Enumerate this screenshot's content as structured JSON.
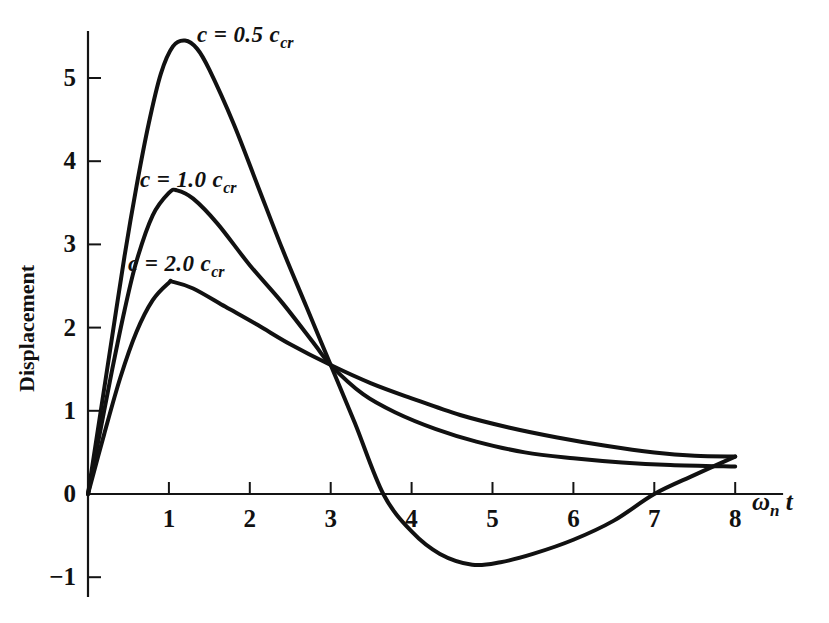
{
  "figure": {
    "background_color": "#ffffff",
    "ink_color": "#111111"
  },
  "axis": {
    "x_title_main": "ω",
    "x_title_sub": "n",
    "x_title_tail": "t",
    "y_title": "Displacement",
    "x_tick_labels": [
      "1",
      "2",
      "3",
      "4",
      "5",
      "6",
      "7",
      "8"
    ],
    "y_tick_labels": [
      "5",
      "4",
      "3",
      "2",
      "1",
      "0",
      "−1"
    ]
  },
  "curve_labels": [
    {
      "prefix": "c  =  0.5 c",
      "sub": "cr"
    },
    {
      "prefix": "c  =  1.0 c",
      "sub": "cr"
    },
    {
      "prefix": "c  =  2.0 c",
      "sub": "cr"
    }
  ],
  "chart_data": {
    "type": "line",
    "title": "",
    "xlabel": "ωₙ t",
    "ylabel": "Displacement",
    "xlim": [
      0,
      8.55
    ],
    "ylim": [
      -1.35,
      5.9
    ],
    "xticks": [
      1,
      2,
      3,
      4,
      5,
      6,
      7,
      8
    ],
    "yticks": [
      -1,
      0,
      1,
      2,
      3,
      4,
      5
    ],
    "grid": false,
    "legend": "inline-annotations",
    "series": [
      {
        "name": "c = 0.5 c_cr",
        "label_text": "c  =  0.5 c_cr",
        "peak_value": 5.45,
        "peak_x": 1.2,
        "min_value": -0.85,
        "min_x": 4.75,
        "zero_crossings": [
          3.65,
          7.0
        ],
        "end_value": 0.45,
        "x": [
          0,
          0.15,
          0.3,
          0.45,
          0.6,
          0.75,
          0.9,
          1.05,
          1.2,
          1.35,
          1.5,
          1.8,
          2.1,
          2.4,
          2.7,
          3.0,
          3.3,
          3.65,
          4.0,
          4.35,
          4.75,
          5.1,
          5.5,
          6.0,
          6.5,
          7.0,
          7.5,
          8.0
        ],
        "y": [
          0,
          0.95,
          1.9,
          2.85,
          3.7,
          4.45,
          5.05,
          5.38,
          5.45,
          5.35,
          5.1,
          4.45,
          3.7,
          2.95,
          2.25,
          1.55,
          0.85,
          0.0,
          -0.45,
          -0.72,
          -0.85,
          -0.82,
          -0.72,
          -0.55,
          -0.32,
          0.0,
          0.23,
          0.45
        ]
      },
      {
        "name": "c = 1.0 c_cr",
        "label_text": "c  =  1.0 c_cr",
        "peak_value": 3.65,
        "peak_x": 1.1,
        "min_value": null,
        "end_value": 0.33,
        "x": [
          0,
          0.15,
          0.3,
          0.45,
          0.6,
          0.8,
          1.0,
          1.1,
          1.3,
          1.6,
          2.0,
          2.4,
          2.8,
          3.0,
          3.4,
          3.8,
          4.3,
          4.8,
          5.4,
          6.0,
          6.6,
          7.2,
          8.0
        ],
        "y": [
          0,
          0.75,
          1.5,
          2.2,
          2.8,
          3.35,
          3.62,
          3.65,
          3.55,
          3.25,
          2.75,
          2.3,
          1.8,
          1.55,
          1.2,
          0.98,
          0.78,
          0.63,
          0.5,
          0.43,
          0.38,
          0.35,
          0.33
        ]
      },
      {
        "name": "c = 2.0 c_cr",
        "label_text": "c  =  2.0 c_cr",
        "peak_value": 2.55,
        "peak_x": 1.05,
        "min_value": null,
        "end_value": 0.45,
        "x": [
          0,
          0.2,
          0.4,
          0.6,
          0.8,
          1.0,
          1.05,
          1.3,
          1.7,
          2.1,
          2.5,
          3.0,
          3.5,
          4.0,
          4.6,
          5.2,
          5.8,
          6.4,
          7.0,
          7.5,
          8.0
        ],
        "y": [
          0,
          0.72,
          1.4,
          1.95,
          2.33,
          2.54,
          2.55,
          2.47,
          2.25,
          2.03,
          1.8,
          1.55,
          1.33,
          1.15,
          0.95,
          0.8,
          0.68,
          0.58,
          0.5,
          0.46,
          0.45
        ]
      }
    ]
  },
  "geometry": {
    "origin_px": {
      "x": 88,
      "y": 494
    },
    "x_unit_px": 80.9,
    "y_unit_px": 83.2
  }
}
